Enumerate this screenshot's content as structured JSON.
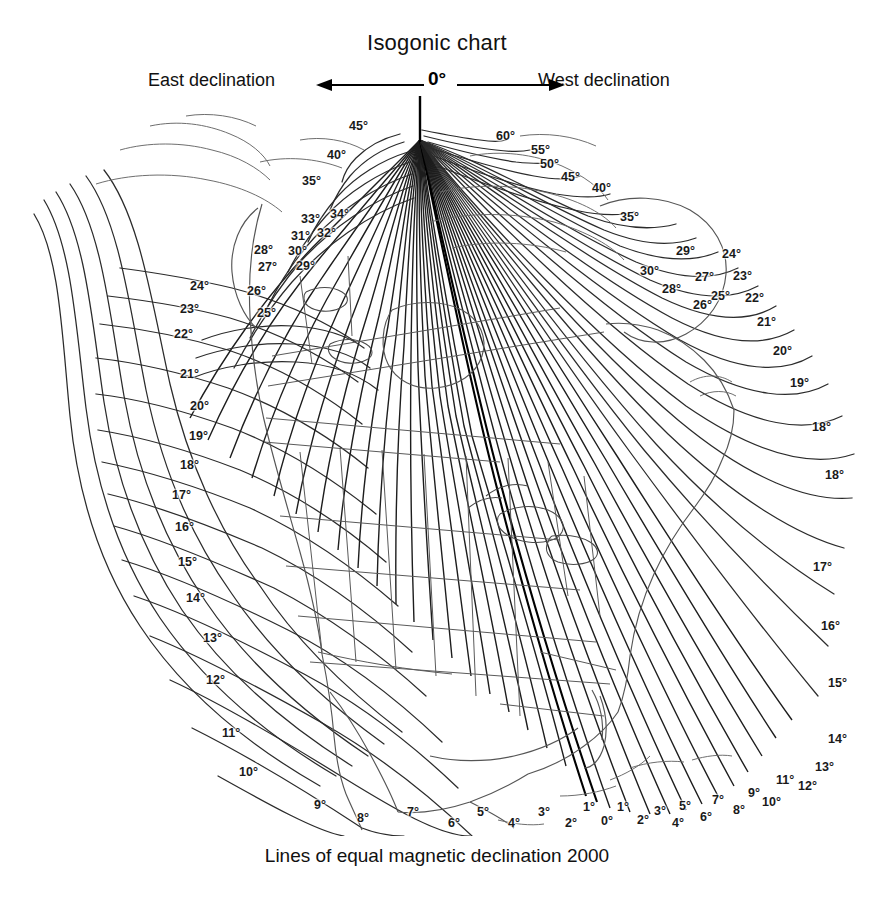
{
  "header": {
    "title": "Isogonic chart",
    "east_label": "East declination",
    "west_label": "West declination",
    "zero_label": "0°",
    "left_arrow_icon": "arrow-left-icon",
    "right_arrow_icon": "arrow-right-icon"
  },
  "caption": "Lines of equal magnetic declination 2000",
  "chart_data": {
    "type": "contour",
    "title": "Isogonic chart",
    "subtitle": "Lines of equal magnetic declination 2000",
    "epoch": "2000",
    "quantity": "magnetic declination",
    "unit": "degrees",
    "contour_interval": 1,
    "zero_contour": "0°",
    "east_side": "East declination",
    "west_side": "West declination",
    "projection_note": "Lines converge at the north magnetic pole",
    "region": "North America",
    "magnetic_pole": {
      "x": 420,
      "y": 44
    },
    "contour_values_west": [
      1,
      2,
      3,
      4,
      5,
      6,
      7,
      8,
      9,
      10,
      11,
      12,
      13,
      14,
      15,
      16,
      17,
      18,
      19,
      20,
      21,
      22,
      23,
      24,
      25,
      26,
      27,
      28,
      29,
      30,
      35,
      40,
      45,
      50,
      55,
      60
    ],
    "contour_values_east": [
      1,
      2,
      3,
      4,
      5,
      6,
      7,
      8,
      9,
      10,
      11,
      12,
      13,
      14,
      15,
      16,
      17,
      18,
      19,
      20,
      21,
      22,
      23,
      24,
      25,
      26,
      27,
      28,
      29,
      30,
      31,
      32,
      33,
      34,
      35,
      40,
      45
    ],
    "labels": [
      {
        "text": "45°",
        "x": 349,
        "y": 120,
        "group": "top-center-east"
      },
      {
        "text": "40°",
        "x": 327,
        "y": 149,
        "group": "top-center-east"
      },
      {
        "text": "35°",
        "x": 302,
        "y": 175,
        "group": "top-center-east"
      },
      {
        "text": "33°",
        "x": 301,
        "y": 213,
        "group": "top-center-east"
      },
      {
        "text": "34°",
        "x": 330,
        "y": 208,
        "group": "top-center-east"
      },
      {
        "text": "31°",
        "x": 291,
        "y": 230,
        "group": "top-center-east"
      },
      {
        "text": "32°",
        "x": 317,
        "y": 227,
        "group": "top-center-east"
      },
      {
        "text": "30°",
        "x": 288,
        "y": 245,
        "group": "top-center-east"
      },
      {
        "text": "29°",
        "x": 296,
        "y": 260,
        "group": "top-center-east"
      },
      {
        "text": "28°",
        "x": 254,
        "y": 244,
        "group": "left-east"
      },
      {
        "text": "27°",
        "x": 258,
        "y": 261,
        "group": "left-east"
      },
      {
        "text": "26°",
        "x": 247,
        "y": 285,
        "group": "left-east"
      },
      {
        "text": "25°",
        "x": 257,
        "y": 307,
        "group": "left-east"
      },
      {
        "text": "24°",
        "x": 190,
        "y": 280,
        "group": "left-east"
      },
      {
        "text": "23°",
        "x": 180,
        "y": 303,
        "group": "left-east"
      },
      {
        "text": "22°",
        "x": 174,
        "y": 328,
        "group": "left-east"
      },
      {
        "text": "21°",
        "x": 180,
        "y": 368,
        "group": "left-east"
      },
      {
        "text": "20°",
        "x": 190,
        "y": 400,
        "group": "left-east"
      },
      {
        "text": "19°",
        "x": 189,
        "y": 430,
        "group": "left-east"
      },
      {
        "text": "18°",
        "x": 180,
        "y": 459,
        "group": "left-east"
      },
      {
        "text": "17°",
        "x": 172,
        "y": 489,
        "group": "left-east"
      },
      {
        "text": "16°",
        "x": 175,
        "y": 521,
        "group": "left-east"
      },
      {
        "text": "15°",
        "x": 178,
        "y": 556,
        "group": "left-east"
      },
      {
        "text": "14°",
        "x": 186,
        "y": 592,
        "group": "left-east"
      },
      {
        "text": "13°",
        "x": 203,
        "y": 632,
        "group": "left-east"
      },
      {
        "text": "12°",
        "x": 206,
        "y": 674,
        "group": "left-east"
      },
      {
        "text": "11°",
        "x": 222,
        "y": 727,
        "group": "left-east"
      },
      {
        "text": "10°",
        "x": 239,
        "y": 766,
        "group": "left-east"
      },
      {
        "text": "9°",
        "x": 314,
        "y": 799,
        "group": "bottom-east"
      },
      {
        "text": "8°",
        "x": 357,
        "y": 812,
        "group": "bottom-east"
      },
      {
        "text": "7°",
        "x": 407,
        "y": 806,
        "group": "bottom-east"
      },
      {
        "text": "6°",
        "x": 448,
        "y": 817,
        "group": "bottom-east"
      },
      {
        "text": "5°",
        "x": 477,
        "y": 806,
        "group": "bottom-east"
      },
      {
        "text": "4°",
        "x": 508,
        "y": 817,
        "group": "bottom-east"
      },
      {
        "text": "3°",
        "x": 538,
        "y": 806,
        "group": "bottom-east"
      },
      {
        "text": "2°",
        "x": 565,
        "y": 817,
        "group": "bottom-east"
      },
      {
        "text": "1°",
        "x": 583,
        "y": 801,
        "group": "bottom-east"
      },
      {
        "text": "0°",
        "x": 601,
        "y": 815,
        "group": "bottom-zero"
      },
      {
        "text": "1°",
        "x": 617,
        "y": 801,
        "group": "bottom-west"
      },
      {
        "text": "2°",
        "x": 637,
        "y": 814,
        "group": "bottom-west"
      },
      {
        "text": "3°",
        "x": 654,
        "y": 805,
        "group": "bottom-west"
      },
      {
        "text": "4°",
        "x": 672,
        "y": 817,
        "group": "bottom-west"
      },
      {
        "text": "5°",
        "x": 679,
        "y": 800,
        "group": "bottom-west"
      },
      {
        "text": "6°",
        "x": 700,
        "y": 811,
        "group": "bottom-west"
      },
      {
        "text": "7°",
        "x": 712,
        "y": 794,
        "group": "bottom-west"
      },
      {
        "text": "8°",
        "x": 733,
        "y": 804,
        "group": "bottom-west"
      },
      {
        "text": "9°",
        "x": 748,
        "y": 787,
        "group": "bottom-west"
      },
      {
        "text": "10°",
        "x": 762,
        "y": 796,
        "group": "bottom-west"
      },
      {
        "text": "11°",
        "x": 776,
        "y": 774,
        "group": "bottom-west"
      },
      {
        "text": "12°",
        "x": 798,
        "y": 780,
        "group": "bottom-west"
      },
      {
        "text": "13°",
        "x": 815,
        "y": 761,
        "group": "right-west"
      },
      {
        "text": "14°",
        "x": 828,
        "y": 733,
        "group": "right-west"
      },
      {
        "text": "15°",
        "x": 828,
        "y": 677,
        "group": "right-west"
      },
      {
        "text": "16°",
        "x": 821,
        "y": 620,
        "group": "right-west"
      },
      {
        "text": "17°",
        "x": 813,
        "y": 561,
        "group": "right-west"
      },
      {
        "text": "18°",
        "x": 825,
        "y": 469,
        "group": "right-west"
      },
      {
        "text": "18°",
        "x": 812,
        "y": 421,
        "group": "right-west"
      },
      {
        "text": "19°",
        "x": 790,
        "y": 377,
        "group": "right-west"
      },
      {
        "text": "20°",
        "x": 773,
        "y": 345,
        "group": "right-west"
      },
      {
        "text": "21°",
        "x": 757,
        "y": 316,
        "group": "right-west"
      },
      {
        "text": "22°",
        "x": 745,
        "y": 292,
        "group": "right-west"
      },
      {
        "text": "23°",
        "x": 733,
        "y": 270,
        "group": "right-west"
      },
      {
        "text": "24°",
        "x": 722,
        "y": 248,
        "group": "right-west"
      },
      {
        "text": "25°",
        "x": 711,
        "y": 290,
        "group": "right-west"
      },
      {
        "text": "26°",
        "x": 693,
        "y": 299,
        "group": "right-west"
      },
      {
        "text": "27°",
        "x": 695,
        "y": 271,
        "group": "right-west"
      },
      {
        "text": "28°",
        "x": 662,
        "y": 283,
        "group": "right-west"
      },
      {
        "text": "29°",
        "x": 676,
        "y": 245,
        "group": "right-west"
      },
      {
        "text": "30°",
        "x": 640,
        "y": 265,
        "group": "right-west"
      },
      {
        "text": "35°",
        "x": 620,
        "y": 211,
        "group": "top-west"
      },
      {
        "text": "40°",
        "x": 592,
        "y": 182,
        "group": "top-west"
      },
      {
        "text": "45°",
        "x": 561,
        "y": 171,
        "group": "top-west"
      },
      {
        "text": "50°",
        "x": 540,
        "y": 158,
        "group": "top-west"
      },
      {
        "text": "55°",
        "x": 531,
        "y": 144,
        "group": "top-west"
      },
      {
        "text": "60°",
        "x": 496,
        "y": 130,
        "group": "top-west"
      }
    ]
  }
}
